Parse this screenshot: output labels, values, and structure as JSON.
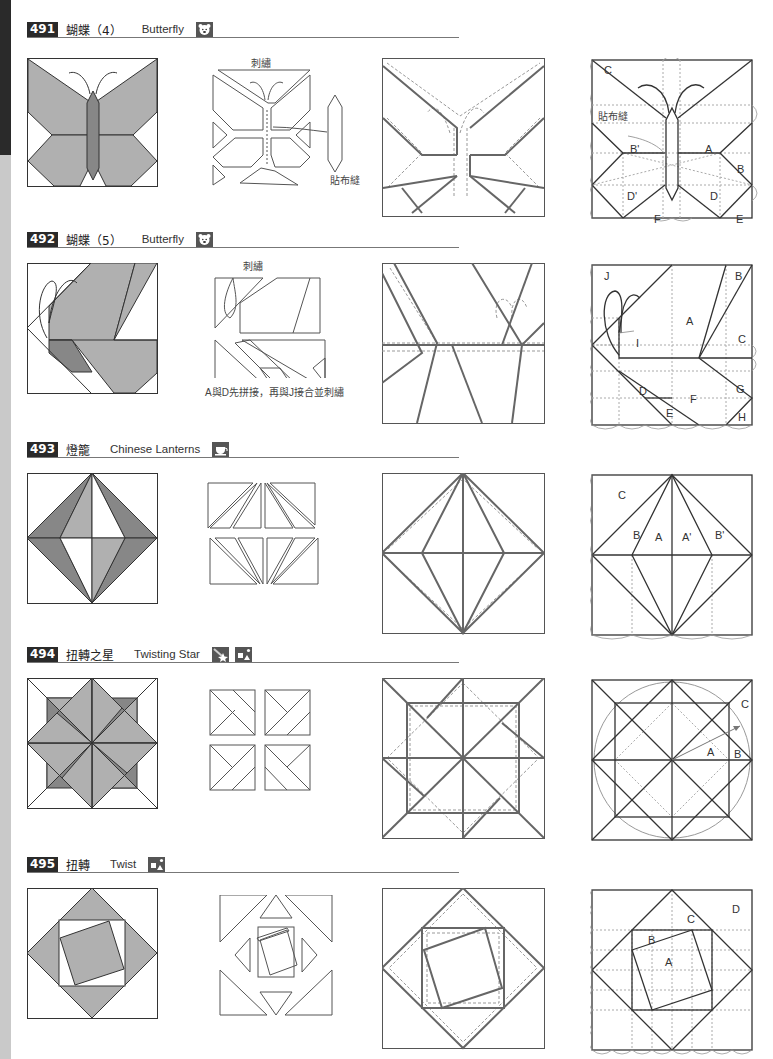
{
  "page": {
    "edge_tab": {
      "colors": {
        "dark": "#2a2a2a",
        "light": "#c9c9c9"
      }
    }
  },
  "colors": {
    "fill_light": "#b0b0b0",
    "fill_dark": "#878787",
    "line": "#333333",
    "dashed": "#9a9a9a",
    "badge": "#555555"
  },
  "patterns": [
    {
      "number": "491",
      "name_zh": "蝴蝶（4）",
      "name_en": "Butterfly",
      "badges": [
        "bear-icon"
      ],
      "notes": {
        "embroidery": "刺繡",
        "applique": "貼布縫"
      },
      "labels": [
        "C",
        "B'",
        "A",
        "B",
        "D'",
        "D",
        "F",
        "E"
      ]
    },
    {
      "number": "492",
      "name_zh": "蝴蝶（5）",
      "name_en": "Butterfly",
      "badges": [
        "bear-icon"
      ],
      "notes": {
        "embroidery": "刺繡",
        "instruction": "A與D先拼接，再與J接合並刺繡"
      },
      "labels": [
        "J",
        "B",
        "A",
        "C",
        "I",
        "D",
        "F",
        "G",
        "E",
        "H"
      ]
    },
    {
      "number": "493",
      "name_zh": "燈籠",
      "name_en": "Chinese Lanterns",
      "badges": [
        "cup-icon"
      ],
      "labels": [
        "C",
        "B",
        "A",
        "A'",
        "B'"
      ]
    },
    {
      "number": "494",
      "name_zh": "扭轉之星",
      "name_en": "Twisting Star",
      "badges": [
        "star-icon",
        "shapes-icon"
      ],
      "labels": [
        "C",
        "A",
        "B"
      ]
    },
    {
      "number": "495",
      "name_zh": "扭轉",
      "name_en": "Twist",
      "badges": [
        "shapes-icon"
      ],
      "labels": [
        "D",
        "C",
        "B",
        "A"
      ]
    }
  ]
}
